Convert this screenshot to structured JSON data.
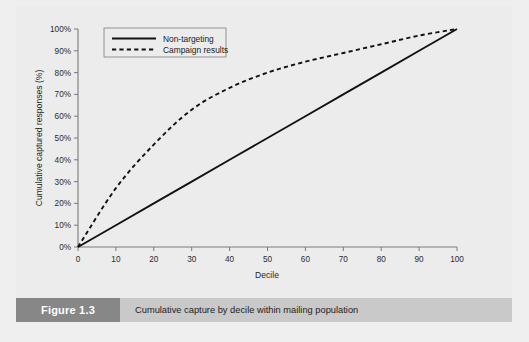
{
  "figure": {
    "number_label": "Figure 1.3",
    "caption": "Cumulative capture by decile within mailing population"
  },
  "colors": {
    "page_background": "#efefef",
    "panel_background": "#ececec",
    "axis": "#7a7a7a",
    "series": "#111111",
    "fig_number_bar": "#878787",
    "caption_bar": "#c9c9c9",
    "fig_number_text": "#ffffff"
  },
  "chart_data": {
    "type": "line",
    "title": "",
    "xlabel": "Decile",
    "ylabel": "Cumulative captured responses (%)",
    "xlim": [
      0,
      100
    ],
    "ylim": [
      0,
      100
    ],
    "grid": false,
    "legend_position": "top-left",
    "xticks": [
      0,
      10,
      20,
      30,
      40,
      50,
      60,
      70,
      80,
      90,
      100
    ],
    "xticklabels": [
      "0",
      "10",
      "20",
      "30",
      "40",
      "50",
      "60",
      "70",
      "80",
      "90",
      "100"
    ],
    "yticks": [
      0,
      10,
      20,
      30,
      40,
      50,
      60,
      70,
      80,
      90,
      100
    ],
    "yticklabels": [
      "0%",
      "10%",
      "20%",
      "30%",
      "40%",
      "50%",
      "60%",
      "70%",
      "80%",
      "90%",
      "100%"
    ],
    "x": [
      0,
      10,
      20,
      30,
      40,
      50,
      60,
      70,
      80,
      90,
      100
    ],
    "series": [
      {
        "name": "Non-targeting",
        "style": "solid",
        "values": [
          0,
          10,
          20,
          30,
          40,
          50,
          60,
          70,
          80,
          90,
          100
        ]
      },
      {
        "name": "Campaign results",
        "style": "dashed",
        "values": [
          0,
          27,
          47,
          63,
          73,
          80,
          85,
          89,
          93,
          97,
          100
        ]
      }
    ]
  },
  "legend": {
    "entries": [
      {
        "label": "Non-targeting",
        "style": "solid"
      },
      {
        "label": "Campaign results",
        "style": "dashed"
      }
    ]
  }
}
